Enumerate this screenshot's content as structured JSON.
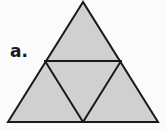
{
  "figure": {
    "label": "a.",
    "background_color": "#fbfbfb",
    "fill_color": "#d0d0d0",
    "stroke_color": "#1a1a1a",
    "stroke_width": 2,
    "geometry": {
      "outer_triangle": {
        "apex": [
          83,
          2
        ],
        "bottom_left": [
          8,
          122
        ],
        "bottom_right": [
          158,
          122
        ]
      },
      "midpoints": {
        "left_edge": [
          45,
          61
        ],
        "right_edge": [
          121,
          61
        ],
        "base_center": [
          83,
          122
        ]
      },
      "interior_segments": [
        {
          "name": "horizontal-midline",
          "from": [
            45,
            61
          ],
          "to": [
            121,
            61
          ]
        },
        {
          "name": "left-median-segment",
          "from": [
            45,
            61
          ],
          "to": [
            83,
            122
          ]
        },
        {
          "name": "right-median-segment",
          "from": [
            121,
            61
          ],
          "to": [
            83,
            122
          ]
        }
      ],
      "sub_triangles": [
        {
          "name": "top-triangle",
          "points": "83,2 45,61 121,61"
        },
        {
          "name": "bottom-left-triangle",
          "points": "45,61 8,122 83,122"
        },
        {
          "name": "center-inverted-triangle",
          "points": "45,61 121,61 83,122"
        },
        {
          "name": "bottom-right-triangle",
          "points": "121,61 83,122 158,122"
        }
      ]
    }
  }
}
